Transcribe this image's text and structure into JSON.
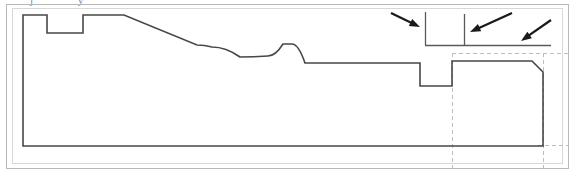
{
  "document": {
    "type": "technical-drawing",
    "title": "Cross-section profile detail view",
    "canvas": {
      "width": 574,
      "height": 173
    },
    "background_color": "#ffffff"
  },
  "colors": {
    "profile_line": "#474747",
    "frame_border": "#b9b9b9",
    "inner_frame_border": "#d8d8d8",
    "dashed_guide": "#bdbdbd",
    "arrow": "#1a1a1a",
    "detail_line": "#5a5a5a",
    "clipped_text": "#8a8a8a"
  },
  "frame": {
    "outer": {
      "x": 6,
      "y": 4,
      "width": 562,
      "height": 164,
      "stroke_width": 1
    },
    "inner": {
      "x": 12,
      "y": 8,
      "width": 550,
      "height": 155,
      "stroke_width": 1
    }
  },
  "clipped_text": {
    "visible": true,
    "note": "partially cropped text descenders along top edge",
    "glyphs": [
      {
        "x": 30,
        "y": 0,
        "char": "j"
      },
      {
        "x": 78,
        "y": 0,
        "char": "y"
      }
    ]
  },
  "profile": {
    "name": "machined-part-cross-section",
    "stroke_width": 1.6,
    "description": "Closed outline: left step notch, long descending ramp, wavy trough and crest, lower shelf, rectangular groove, raised right block with 45 degree chamfer",
    "points": [
      {
        "x": 23,
        "y": 146,
        "kind": "corner",
        "label": "bottom-left"
      },
      {
        "x": 23,
        "y": 15,
        "kind": "corner",
        "label": "top-left"
      },
      {
        "x": 47,
        "y": 15,
        "kind": "corner",
        "label": "notch-left-top"
      },
      {
        "x": 47,
        "y": 33,
        "kind": "corner",
        "label": "notch-left-bottom"
      },
      {
        "x": 83,
        "y": 33,
        "kind": "corner",
        "label": "notch-right-bottom"
      },
      {
        "x": 83,
        "y": 15,
        "kind": "corner",
        "label": "notch-right-top"
      },
      {
        "x": 124,
        "y": 15,
        "kind": "corner",
        "label": "ramp-start"
      },
      {
        "x": 197,
        "y": 45,
        "kind": "corner",
        "label": "ramp-end"
      },
      {
        "x": 212,
        "y": 47,
        "kind": "smooth",
        "label": "trough-entry"
      },
      {
        "x": 240,
        "y": 57,
        "kind": "smooth",
        "label": "trough-bottom"
      },
      {
        "x": 268,
        "y": 56,
        "kind": "smooth",
        "label": "trough-exit"
      },
      {
        "x": 283,
        "y": 44,
        "kind": "smooth",
        "label": "crest-top"
      },
      {
        "x": 292,
        "y": 44,
        "kind": "smooth",
        "label": "crest-end"
      },
      {
        "x": 305,
        "y": 63,
        "kind": "smooth",
        "label": "shelf-entry"
      },
      {
        "x": 420,
        "y": 63,
        "kind": "corner",
        "label": "groove-left-top"
      },
      {
        "x": 420,
        "y": 86,
        "kind": "corner",
        "label": "groove-left-bottom"
      },
      {
        "x": 452,
        "y": 86,
        "kind": "corner",
        "label": "groove-right-bottom"
      },
      {
        "x": 452,
        "y": 61,
        "kind": "corner",
        "label": "groove-right-top"
      },
      {
        "x": 532,
        "y": 61,
        "kind": "corner",
        "label": "block-top-right-start"
      },
      {
        "x": 543,
        "y": 72,
        "kind": "corner",
        "label": "chamfer-end"
      },
      {
        "x": 543,
        "y": 146,
        "kind": "corner",
        "label": "bottom-right"
      }
    ]
  },
  "detail_lines": {
    "name": "upper-detail-callout",
    "horizontal": {
      "x1": 425,
      "y1": 45,
      "x2": 551,
      "y2": 45
    },
    "verticals": [
      {
        "x": 425,
        "y1": 12,
        "y2": 45,
        "name": "detail-tick-left"
      },
      {
        "x": 464,
        "y1": 14,
        "y2": 45,
        "name": "detail-tick-right"
      }
    ]
  },
  "dashed_guides": [
    {
      "name": "dashed-horizontal-upper",
      "x1": 452,
      "y1": 53,
      "x2": 568,
      "y2": 53,
      "orientation": "horizontal"
    },
    {
      "name": "dashed-horizontal-lower",
      "x1": 538,
      "y1": 145,
      "x2": 568,
      "y2": 145,
      "orientation": "horizontal"
    },
    {
      "name": "dashed-vertical-left",
      "x": 452,
      "y1": 53,
      "y2": 168,
      "orientation": "vertical"
    },
    {
      "name": "dashed-vertical-right",
      "x": 543,
      "y1": 53,
      "y2": 168,
      "orientation": "vertical"
    }
  ],
  "arrows": [
    {
      "name": "annotation-arrow-1",
      "direction": "right-down",
      "tail": {
        "x": 391,
        "y": 13
      },
      "head": {
        "x": 420,
        "y": 27
      }
    },
    {
      "name": "annotation-arrow-2",
      "direction": "left-down",
      "tail": {
        "x": 512,
        "y": 13
      },
      "head": {
        "x": 470,
        "y": 32
      }
    },
    {
      "name": "annotation-arrow-3",
      "direction": "left-down",
      "tail": {
        "x": 551,
        "y": 20
      },
      "head": {
        "x": 521,
        "y": 41
      }
    }
  ]
}
